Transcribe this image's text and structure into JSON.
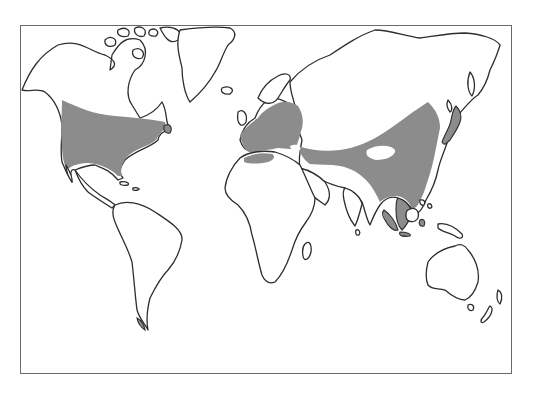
{
  "map": {
    "type": "world-distribution-map",
    "projection": "equirectangular-like",
    "colors": {
      "background": "#ffffff",
      "outline": "#2e2e2e",
      "distribution_shading": "#8c8c8c",
      "frame": "#6a6a6a"
    },
    "shaded_regions": [
      "North America (USA and southern Canada)",
      "Europe",
      "Central Asia band",
      "East Asia (China, Korea)",
      "Japan",
      "Southeast Asia and Indonesia",
      "Southern tip of South America"
    ],
    "unshaded_landmasses": [
      "Alaska and northern Canada",
      "Greenland",
      "Central America",
      "South America",
      "Africa",
      "Madagascar",
      "Arabia",
      "India",
      "Siberia",
      "Australia",
      "Tasmania",
      "New Zealand",
      "New Guinea"
    ]
  }
}
